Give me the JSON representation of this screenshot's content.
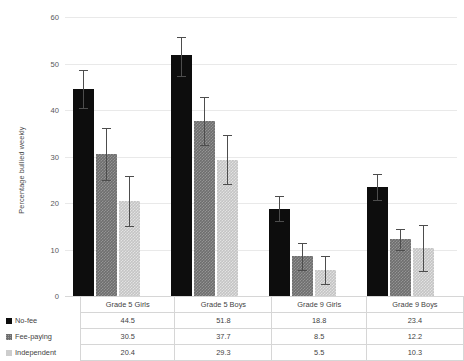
{
  "chart_data": {
    "type": "bar",
    "title": "",
    "xlabel": "",
    "ylabel": "Percentage bullied weekly",
    "ylim": [
      0,
      60
    ],
    "yticks": [
      0,
      10,
      20,
      30,
      40,
      50,
      60
    ],
    "grid": true,
    "legend_position": "bottom-left-table",
    "categories": [
      "Grade 5 Girls",
      "Grade 5 Boys",
      "Grade 9 Girls",
      "Grade 9 Boys"
    ],
    "series": [
      {
        "name": "No-fee",
        "color": "#0d0d0d",
        "values": [
          44.5,
          51.8,
          18.8,
          23.4
        ],
        "error_low": [
          40.5,
          47.4,
          16.2,
          20.6
        ],
        "error_high": [
          48.6,
          55.6,
          21.4,
          26.3
        ]
      },
      {
        "name": "Fee-paying",
        "color": "#6e6e6e",
        "values": [
          30.5,
          37.7,
          8.5,
          12.2
        ],
        "error_low": [
          24.9,
          32.4,
          5.5,
          10.0
        ],
        "error_high": [
          36.2,
          42.9,
          11.5,
          14.5
        ]
      },
      {
        "name": "Independent",
        "color": "#c4c4c4",
        "values": [
          20.4,
          29.3,
          5.5,
          10.3
        ],
        "error_low": [
          15.0,
          24.0,
          2.6,
          5.4
        ],
        "error_high": [
          25.8,
          34.6,
          8.5,
          15.3
        ]
      }
    ]
  },
  "table": {
    "header": [
      "Grade 5 Girls",
      "Grade 5 Boys",
      "Grade 9 Girls",
      "Grade 9 Boys"
    ],
    "rows": [
      {
        "label": "No-fee",
        "values": [
          "44.5",
          "51.8",
          "18.8",
          "23.4"
        ]
      },
      {
        "label": "Fee-paying",
        "values": [
          "30.5",
          "37.7",
          "8.5",
          "12.2"
        ]
      },
      {
        "label": "Independent",
        "values": [
          "20.4",
          "29.3",
          "5.5",
          "10.3"
        ]
      }
    ]
  }
}
